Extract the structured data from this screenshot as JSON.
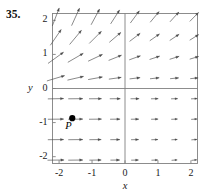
{
  "figure": {
    "number_label": "35.",
    "x_axis_name": "x",
    "y_axis_name": "y",
    "x_tick_labels": [
      "-2",
      "-1",
      "0",
      "1",
      "2"
    ],
    "y_tick_labels": [
      "2",
      "1",
      "0",
      "-1",
      "-2"
    ],
    "point_label": "P",
    "colors": {
      "frame": "#808080",
      "axis": "#808080",
      "arrow": "#4a4a4a",
      "point": "#000000",
      "text": "#1a1a1a"
    }
  },
  "chart_data": {
    "type": "scatter",
    "title": "",
    "xlabel": "x",
    "ylabel": "y",
    "xlim": [
      -2.2,
      2.2
    ],
    "ylim": [
      -2.2,
      2.2
    ],
    "grid": false,
    "legend": null,
    "xticks": [
      -2,
      -1,
      0,
      1,
      2
    ],
    "yticks": [
      -2,
      -1,
      0,
      1,
      2
    ],
    "point_P": {
      "x": -1.6,
      "y": -0.87,
      "label": "P"
    },
    "field_x": [
      -2.1,
      -1.5,
      -0.9,
      -0.3,
      0.3,
      0.9,
      1.5,
      2.1
    ],
    "field_y": [
      2.1,
      1.5,
      0.9,
      0.3,
      -0.3,
      -0.9,
      -1.5,
      -2.1
    ],
    "field_slopes": [
      [
        2.6,
        2.2,
        1.85,
        1.55,
        1.35,
        1.2,
        1.1,
        1.02
      ],
      [
        1.45,
        1.2,
        1.0,
        0.86,
        0.76,
        0.7,
        0.66,
        0.63
      ],
      [
        0.72,
        0.58,
        0.47,
        0.4,
        0.36,
        0.33,
        0.31,
        0.3
      ],
      [
        0.3,
        0.23,
        0.18,
        0.14,
        0.12,
        0.11,
        0.1,
        0.1
      ],
      [
        0.02,
        0.01,
        0.01,
        0.01,
        0.01,
        0.02,
        0.03,
        0.04
      ],
      [
        0.01,
        0.01,
        0.01,
        0.01,
        0.01,
        0.02,
        0.04,
        0.06
      ],
      [
        0.01,
        0.01,
        0.01,
        0.01,
        0.02,
        0.03,
        0.05,
        0.08
      ],
      [
        0.01,
        0.01,
        0.01,
        0.01,
        0.02,
        0.04,
        0.07,
        0.1
      ]
    ],
    "field_lengths": [
      [
        0.56,
        0.56,
        0.52,
        0.48,
        0.44,
        0.4,
        0.38,
        0.36
      ],
      [
        0.56,
        0.54,
        0.5,
        0.44,
        0.38,
        0.34,
        0.32,
        0.3
      ],
      [
        0.56,
        0.52,
        0.46,
        0.4,
        0.34,
        0.3,
        0.28,
        0.26
      ],
      [
        0.54,
        0.48,
        0.42,
        0.36,
        0.3,
        0.26,
        0.24,
        0.22
      ],
      [
        0.46,
        0.42,
        0.36,
        0.3,
        0.24,
        0.2,
        0.18,
        0.17
      ],
      [
        0.46,
        0.42,
        0.36,
        0.28,
        0.22,
        0.19,
        0.17,
        0.16
      ],
      [
        0.46,
        0.42,
        0.34,
        0.27,
        0.21,
        0.18,
        0.16,
        0.15
      ],
      [
        0.48,
        0.42,
        0.34,
        0.26,
        0.2,
        0.17,
        0.15,
        0.14
      ]
    ]
  }
}
